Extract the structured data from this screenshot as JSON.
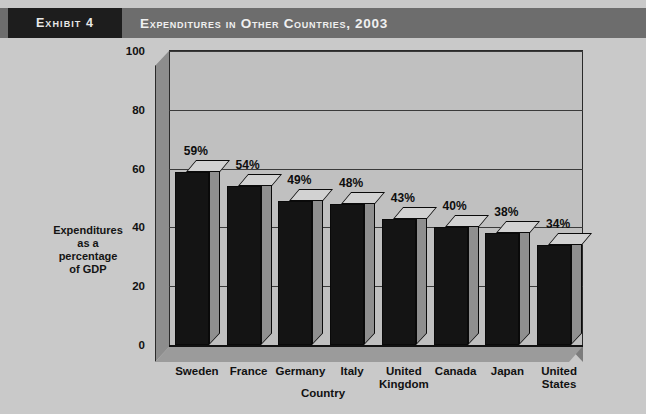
{
  "header": {
    "exhibit_tag": "Exhibit 4",
    "title": "Expenditures in Other Countries, 2003"
  },
  "chart_data": {
    "type": "bar",
    "title": "Expenditures in Other Countries, 2003",
    "xlabel": "Country",
    "ylabel": "Expenditures as a percentage of GDP",
    "ylabel_lines": [
      "Expenditures",
      "as a",
      "percentage",
      "of GDP"
    ],
    "categories": [
      "Sweden",
      "France",
      "Germany",
      "Italy",
      "United Kingdom",
      "Canada",
      "Japan",
      "United States"
    ],
    "category_lines": [
      [
        "Sweden"
      ],
      [
        "France"
      ],
      [
        "Germany"
      ],
      [
        "Italy"
      ],
      [
        "United",
        "Kingdom"
      ],
      [
        "Canada"
      ],
      [
        "Japan"
      ],
      [
        "United",
        "States"
      ]
    ],
    "values": [
      59,
      54,
      49,
      48,
      43,
      40,
      38,
      34
    ],
    "value_labels": [
      "59%",
      "54%",
      "49%",
      "48%",
      "43%",
      "40%",
      "38%",
      "34%"
    ],
    "ylim": [
      0,
      100
    ],
    "yticks": [
      0,
      20,
      40,
      60,
      80,
      100
    ],
    "ytick_labels": [
      "0",
      "20",
      "40",
      "60",
      "80",
      "100"
    ],
    "grid": true,
    "legend": false,
    "style": "3d-column",
    "colors": {
      "bar_front": "#141414",
      "bar_top": "#d2d2d2",
      "bar_side": "#8f8f8f",
      "plot_background": "#c0c0c0",
      "page_background": "#c9c9c9",
      "header_band": "#6d6d6d",
      "exhibit_tag_background": "#1d1d1d",
      "axis_text": "#111111"
    }
  }
}
